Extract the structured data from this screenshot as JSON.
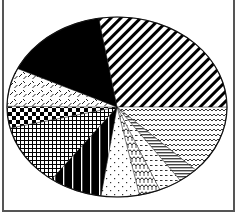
{
  "chart_data": {
    "type": "pie",
    "title": "",
    "legend": [],
    "start_angle_deg": 350.4,
    "direction": "clockwise",
    "center": [
      117,
      99
    ],
    "radii": [
      110,
      90
    ],
    "slices": [
      {
        "name": "diagonal-stripes",
        "pattern": "diagonal",
        "value": 27.7
      },
      {
        "name": "wavy-lines",
        "pattern": "wavy",
        "value": 12.3
      },
      {
        "name": "horizontal-lines",
        "pattern": "hlines",
        "value": 2.9
      },
      {
        "name": "dashes",
        "pattern": "dashes",
        "value": 3.4
      },
      {
        "name": "scallops",
        "pattern": "scallops",
        "value": 3.1
      },
      {
        "name": "sparse-dots",
        "pattern": "dots",
        "value": 5.6
      },
      {
        "name": "black-vertical-lines",
        "pattern": "vlines-black",
        "value": 7.8
      },
      {
        "name": "grid",
        "pattern": "grid",
        "value": 11.1
      },
      {
        "name": "checkerboard",
        "pattern": "checker",
        "value": 3.9
      },
      {
        "name": "diamond-plate",
        "pattern": "diamond",
        "value": 6.9
      },
      {
        "name": "solid-black",
        "pattern": "solid",
        "value": 15.3
      }
    ],
    "colors": {
      "ink": "#000000",
      "background": "#ffffff",
      "frame": "#555555"
    }
  }
}
